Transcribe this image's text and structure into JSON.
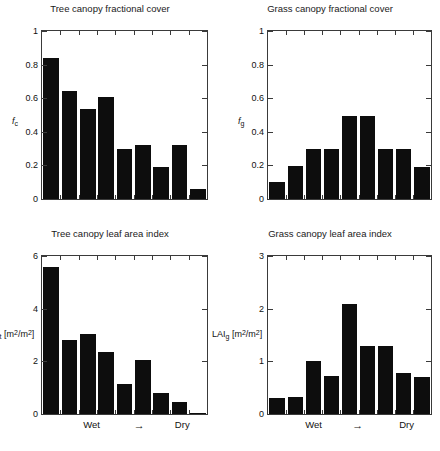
{
  "figure": {
    "background": "#ffffff",
    "bar_color": "#0d0d0d",
    "axis_color": "#3a3a3a",
    "width": 440,
    "height": 451
  },
  "panels": [
    {
      "key": "tree_fc",
      "title": "Tree canopy fractional cover",
      "ylabel_main": "f",
      "ylabel_sub": "c",
      "ylabel_unit": "",
      "ytick_labels": [
        "0",
        "0.2",
        "0.4",
        "0.6",
        "0.8",
        "1"
      ],
      "xlabel_left": "Wet",
      "xlabel_mid": "→",
      "xlabel_right": "Dry",
      "show_xlabels": false
    },
    {
      "key": "grass_fc",
      "title": "Grass canopy fractional cover",
      "ylabel_main": "f",
      "ylabel_sub": "g",
      "ylabel_unit": "",
      "ytick_labels": [
        "0",
        "0.2",
        "0.4",
        "0.6",
        "0.8",
        "1"
      ],
      "xlabel_left": "Wet",
      "xlabel_mid": "→",
      "xlabel_right": "Dry",
      "show_xlabels": false
    },
    {
      "key": "tree_lai",
      "title": "Tree canopy leaf area index",
      "ylabel_main": "LAI",
      "ylabel_sub": "t",
      "ylabel_unit": " [m2/m2]",
      "ytick_labels": [
        "0",
        "2",
        "4",
        "6"
      ],
      "xlabel_left": "Wet",
      "xlabel_mid": "→",
      "xlabel_right": "Dry",
      "show_xlabels": true
    },
    {
      "key": "grass_lai",
      "title": "Grass canopy leaf area index",
      "ylabel_main": "LAI",
      "ylabel_sub": "g",
      "ylabel_unit": " [m2/m2]",
      "ytick_labels": [
        "0",
        "1",
        "2",
        "3"
      ],
      "xlabel_left": "Wet",
      "xlabel_mid": "→",
      "xlabel_right": "Dry",
      "show_xlabels": true
    }
  ],
  "chart_data": [
    {
      "type": "bar",
      "key": "tree_fc",
      "title": "Tree canopy fractional cover",
      "xlabel": "Wet → Dry",
      "ylabel": "f_c",
      "categories": [
        "1",
        "2",
        "3",
        "4",
        "5",
        "6",
        "7",
        "8",
        "9"
      ],
      "values": [
        0.84,
        0.645,
        0.535,
        0.605,
        0.295,
        0.32,
        0.19,
        0.32,
        0.06
      ],
      "ylim": [
        0,
        1
      ],
      "yticks": [
        0,
        0.2,
        0.4,
        0.6,
        0.8,
        1
      ],
      "grid": false,
      "legend": "none"
    },
    {
      "type": "bar",
      "key": "grass_fc",
      "title": "Grass canopy fractional cover",
      "xlabel": "Wet → Dry",
      "ylabel": "f_g",
      "categories": [
        "1",
        "2",
        "3",
        "4",
        "5",
        "6",
        "7",
        "8",
        "9"
      ],
      "values": [
        0.1,
        0.195,
        0.295,
        0.295,
        0.495,
        0.495,
        0.295,
        0.295,
        0.19
      ],
      "ylim": [
        0,
        1
      ],
      "yticks": [
        0,
        0.2,
        0.4,
        0.6,
        0.8,
        1
      ],
      "grid": false,
      "legend": "none"
    },
    {
      "type": "bar",
      "key": "tree_lai",
      "title": "Tree canopy leaf area index",
      "xlabel": "Wet → Dry",
      "ylabel": "LAI_t [m2/m2]",
      "categories": [
        "1",
        "2",
        "3",
        "4",
        "5",
        "6",
        "7",
        "8",
        "9"
      ],
      "values": [
        5.6,
        2.8,
        3.05,
        2.35,
        1.15,
        2.05,
        0.8,
        0.45,
        0.03
      ],
      "ylim": [
        0,
        6
      ],
      "yticks": [
        0,
        2,
        4,
        6
      ],
      "grid": false,
      "legend": "none"
    },
    {
      "type": "bar",
      "key": "grass_lai",
      "title": "Grass canopy leaf area index",
      "xlabel": "Wet → Dry",
      "ylabel": "LAI_g [m2/m2]",
      "categories": [
        "1",
        "2",
        "3",
        "4",
        "5",
        "6",
        "7",
        "8",
        "9"
      ],
      "values": [
        0.3,
        0.33,
        1.0,
        0.72,
        2.09,
        1.3,
        1.3,
        0.77,
        0.71
      ],
      "ylim": [
        0,
        3
      ],
      "yticks": [
        0,
        1,
        2,
        3
      ],
      "grid": false,
      "legend": "none"
    }
  ]
}
